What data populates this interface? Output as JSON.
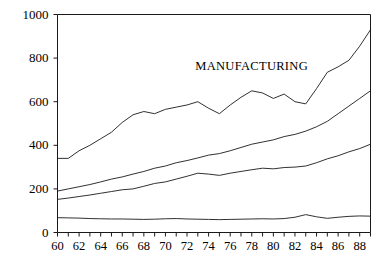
{
  "chart_data": {
    "type": "line",
    "title": "",
    "xlabel": "",
    "ylabel": "",
    "xlim": [
      60,
      89
    ],
    "ylim": [
      0,
      1000
    ],
    "grid": false,
    "legend_position": "inline-annotations",
    "x": [
      60,
      61,
      62,
      63,
      64,
      65,
      66,
      67,
      68,
      69,
      70,
      71,
      72,
      73,
      74,
      75,
      76,
      77,
      78,
      79,
      80,
      81,
      82,
      83,
      84,
      85,
      86,
      87,
      88,
      89
    ],
    "ytick_labels": [
      "0",
      "200",
      "400",
      "600",
      "800",
      "1000"
    ],
    "ytick_values": [
      0,
      200,
      400,
      600,
      800,
      1000
    ],
    "xtick_labels": [
      "60",
      "62",
      "64",
      "66",
      "68",
      "70",
      "72",
      "74",
      "76",
      "78",
      "80",
      "82",
      "84",
      "86",
      "88"
    ],
    "xtick_values": [
      60,
      62,
      64,
      66,
      68,
      70,
      72,
      74,
      76,
      78,
      80,
      82,
      84,
      86,
      88
    ],
    "series": [
      {
        "name": "MANUFACTURING",
        "label_x": 78,
        "label_y": 760,
        "values": [
          340,
          340,
          375,
          400,
          430,
          460,
          505,
          540,
          555,
          545,
          565,
          575,
          585,
          600,
          570,
          545,
          585,
          620,
          650,
          640,
          615,
          635,
          600,
          590,
          660,
          735,
          760,
          790,
          855,
          930
        ]
      },
      {
        "name": "SERVICES",
        "label_x": 260,
        "label_y": 520,
        "values": [
          190,
          200,
          210,
          220,
          232,
          245,
          255,
          268,
          280,
          295,
          305,
          320,
          330,
          342,
          355,
          362,
          375,
          390,
          405,
          415,
          425,
          440,
          450,
          465,
          485,
          510,
          545,
          580,
          615,
          650
        ]
      },
      {
        "name": "RETAIL",
        "label_x": 272,
        "label_y": 355,
        "values": [
          152,
          158,
          165,
          172,
          180,
          188,
          196,
          200,
          212,
          225,
          232,
          245,
          258,
          272,
          268,
          262,
          272,
          280,
          288,
          295,
          292,
          298,
          300,
          305,
          320,
          338,
          352,
          370,
          385,
          405
        ]
      },
      {
        "name": "AGRICULTURE",
        "label_x": 262,
        "label_y": 165,
        "values": [
          68,
          67,
          66,
          64,
          63,
          62,
          62,
          61,
          60,
          61,
          63,
          64,
          62,
          61,
          60,
          59,
          60,
          61,
          62,
          63,
          62,
          64,
          70,
          82,
          72,
          65,
          70,
          74,
          76,
          75
        ]
      }
    ]
  }
}
